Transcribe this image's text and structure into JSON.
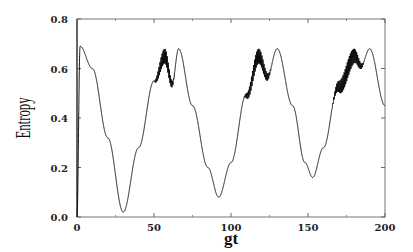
{
  "chart_data": {
    "type": "line",
    "title": "",
    "xlabel": "gt",
    "ylabel": "Entropy",
    "xlim": [
      0,
      200
    ],
    "ylim": [
      0.0,
      0.8
    ],
    "xticks": [
      0,
      50,
      100,
      150,
      200
    ],
    "yticks": [
      0.0,
      0.2,
      0.4,
      0.6,
      0.8
    ],
    "xtick_labels": [
      "0",
      "50",
      "100",
      "150",
      "200"
    ],
    "ytick_labels": [
      "0.0",
      "0.2",
      "0.4",
      "0.6",
      "0.8"
    ],
    "grid": false,
    "legend": null,
    "series": [
      {
        "name": "Entropy",
        "color": "#000000",
        "envelope_points": [
          {
            "x": 0,
            "y": 0.0
          },
          {
            "x": 2,
            "y": 0.69
          },
          {
            "x": 10,
            "y": 0.6
          },
          {
            "x": 20,
            "y": 0.32
          },
          {
            "x": 30,
            "y": 0.02
          },
          {
            "x": 40,
            "y": 0.28
          },
          {
            "x": 50,
            "y": 0.55
          },
          {
            "x": 57,
            "y": 0.68
          },
          {
            "x": 62,
            "y": 0.55
          },
          {
            "x": 66,
            "y": 0.68
          },
          {
            "x": 75,
            "y": 0.45
          },
          {
            "x": 85,
            "y": 0.2
          },
          {
            "x": 92,
            "y": 0.08
          },
          {
            "x": 100,
            "y": 0.22
          },
          {
            "x": 110,
            "y": 0.5
          },
          {
            "x": 118,
            "y": 0.68
          },
          {
            "x": 124,
            "y": 0.58
          },
          {
            "x": 130,
            "y": 0.68
          },
          {
            "x": 140,
            "y": 0.45
          },
          {
            "x": 148,
            "y": 0.22
          },
          {
            "x": 153,
            "y": 0.16
          },
          {
            "x": 160,
            "y": 0.28
          },
          {
            "x": 170,
            "y": 0.55
          },
          {
            "x": 180,
            "y": 0.68
          },
          {
            "x": 185,
            "y": 0.62
          },
          {
            "x": 190,
            "y": 0.68
          },
          {
            "x": 200,
            "y": 0.45
          }
        ],
        "oscillating_regions": [
          {
            "x_start": 50,
            "x_end": 72,
            "amplitude": 0.06
          },
          {
            "x_start": 108,
            "x_end": 138,
            "amplitude": 0.06
          },
          {
            "x_start": 165,
            "x_end": 200,
            "amplitude": 0.07
          }
        ]
      }
    ]
  }
}
